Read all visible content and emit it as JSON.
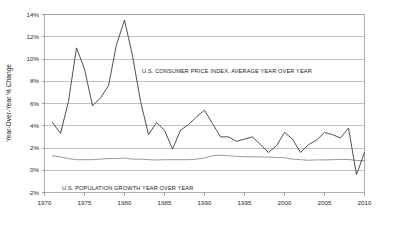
{
  "chart_data": {
    "type": "line",
    "title": "",
    "xlabel": "",
    "ylabel": "Year-Over-Year % Change",
    "xlim": [
      1970,
      2010
    ],
    "ylim": [
      -2,
      14
    ],
    "grid": true,
    "legend_position": "inline-annotation",
    "x_ticks": [
      "1970",
      "1975",
      "1980",
      "1985",
      "1990",
      "1995",
      "2000",
      "2005",
      "2010"
    ],
    "x_tick_values": [
      1970,
      1975,
      1980,
      1985,
      1990,
      1995,
      2000,
      2005,
      2010
    ],
    "y_ticks": [
      "-2%",
      "0%",
      "2%",
      "4%",
      "6%",
      "8%",
      "10%",
      "12%",
      "14%"
    ],
    "y_tick_values": [
      -2,
      0,
      2,
      4,
      6,
      8,
      10,
      12,
      14
    ],
    "x": [
      1971,
      1972,
      1973,
      1974,
      1975,
      1976,
      1977,
      1978,
      1979,
      1980,
      1981,
      1982,
      1983,
      1984,
      1985,
      1986,
      1987,
      1988,
      1989,
      1990,
      1991,
      1992,
      1993,
      1994,
      1995,
      1996,
      1997,
      1998,
      1999,
      2000,
      2001,
      2002,
      2003,
      2004,
      2005,
      2006,
      2007,
      2008,
      2009,
      2010
    ],
    "series": [
      {
        "name": "U.S. CONSUMER PRICE INDEX, AVERAGE YEAR OVER YEAR",
        "annotation": "U.S. CONSUMER PRICE INDEX, AVERAGE YEAR OVER YEAR",
        "color": "#3d3d3d",
        "values": [
          4.3,
          3.3,
          6.2,
          11.0,
          9.1,
          5.8,
          6.5,
          7.6,
          11.3,
          13.5,
          10.3,
          6.2,
          3.2,
          4.3,
          3.6,
          1.9,
          3.6,
          4.1,
          4.8,
          5.4,
          4.2,
          3.0,
          3.0,
          2.6,
          2.8,
          3.0,
          2.3,
          1.6,
          2.2,
          3.4,
          2.8,
          1.6,
          2.3,
          2.7,
          3.4,
          3.2,
          2.9,
          3.8,
          -0.4,
          1.6
        ]
      },
      {
        "name": "U.S. POPULATION GROWTH YEAR OVER YEAR",
        "annotation": "U.S. POPULATION GROWTH YEAR OVER YEAR",
        "color": "#8c8c8c",
        "values": [
          1.3,
          1.2,
          1.05,
          0.95,
          0.95,
          0.95,
          1.0,
          1.05,
          1.05,
          1.1,
          1.0,
          1.0,
          0.95,
          0.92,
          0.95,
          0.95,
          0.95,
          0.95,
          1.0,
          1.1,
          1.3,
          1.35,
          1.3,
          1.25,
          1.22,
          1.2,
          1.2,
          1.18,
          1.15,
          1.12,
          1.0,
          0.95,
          0.9,
          0.93,
          0.93,
          0.95,
          0.97,
          0.97,
          0.88,
          0.85
        ]
      }
    ],
    "annotations": [
      {
        "id": "cpi-label",
        "text": "U.S. CONSUMER PRICE INDEX, AVERAGE YEAR OVER YEAR",
        "x_px": 142,
        "y_px": 73
      },
      {
        "id": "population-label",
        "text": "U.S. POPULATION GROWTH YEAR OVER YEAR",
        "x_px": 62,
        "y_px": 190
      }
    ]
  },
  "axis": {
    "y_title": "Year-Over-Year % Change"
  }
}
